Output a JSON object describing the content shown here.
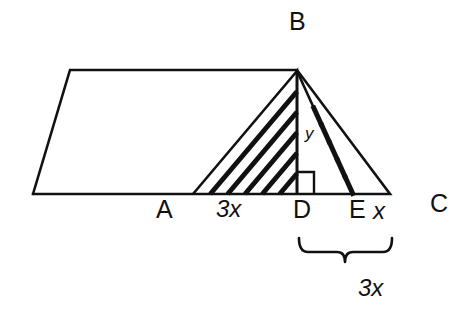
{
  "figure": {
    "stroke_color": "#111111",
    "background_color": "#ffffff"
  },
  "labels": {
    "vertex_b": "B",
    "vertex_a": "A",
    "vertex_d": "D",
    "vertex_e": "E",
    "vertex_c": "C",
    "segment_ad": "3x",
    "segment_ec": "x",
    "height_bd": "y",
    "brace_dc": "3x"
  },
  "geometry": {
    "points": {
      "parallelogram_bottom_left": [
        33,
        194
      ],
      "parallelogram_top_left": [
        70,
        70
      ],
      "parallelogram_top_right": [
        297,
        70
      ],
      "A": [
        193,
        194
      ],
      "B": [
        297,
        71
      ],
      "D": [
        297,
        194
      ],
      "E": [
        353,
        194
      ],
      "C": [
        390,
        194
      ]
    },
    "right_angle_marker": {
      "at": "D",
      "size": 15
    },
    "hatching": {
      "left_triangle": {
        "region": "ABD",
        "direction": "parallel-to-AB",
        "count": 5
      },
      "right_triangle": {
        "region": "BEC",
        "direction": "parallel-to-BE",
        "count": 5
      }
    }
  }
}
